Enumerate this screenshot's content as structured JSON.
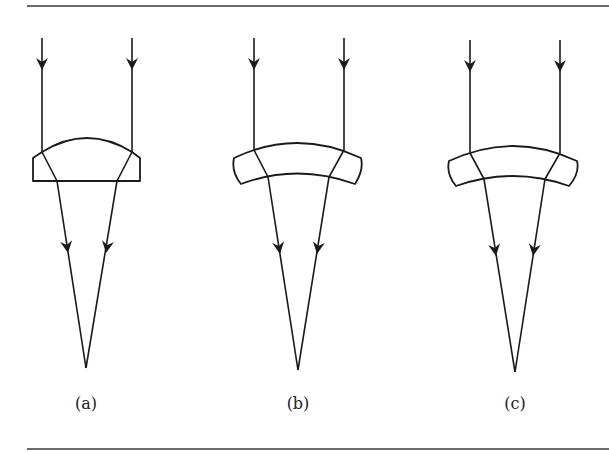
{
  "figure": {
    "panels": [
      {
        "id": "a",
        "label": "(a)",
        "lens_type": "plano-convex"
      },
      {
        "id": "b",
        "label": "(b)",
        "lens_type": "meniscus"
      },
      {
        "id": "c",
        "label": "(c)",
        "lens_type": "meniscus"
      }
    ],
    "colors": {
      "line": "#1a1a1a",
      "rule": "#3a3a3a",
      "background": "#ffffff"
    }
  }
}
